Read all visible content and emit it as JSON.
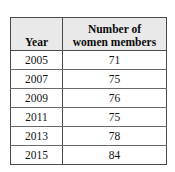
{
  "table": {
    "headers": {
      "year": "Year",
      "value_line1": "Number of",
      "value_line2": "women members"
    },
    "rows": [
      {
        "year": "2005",
        "value": "71"
      },
      {
        "year": "2007",
        "value": "75"
      },
      {
        "year": "2009",
        "value": "76"
      },
      {
        "year": "2011",
        "value": "75"
      },
      {
        "year": "2013",
        "value": "78"
      },
      {
        "year": "2015",
        "value": "84"
      }
    ],
    "colors": {
      "header_background": "#e9e9e9",
      "border": "#4a4a4a",
      "inner_rule": "#6a6a6a",
      "text": "#141414",
      "page_background": "#ffffff"
    }
  }
}
